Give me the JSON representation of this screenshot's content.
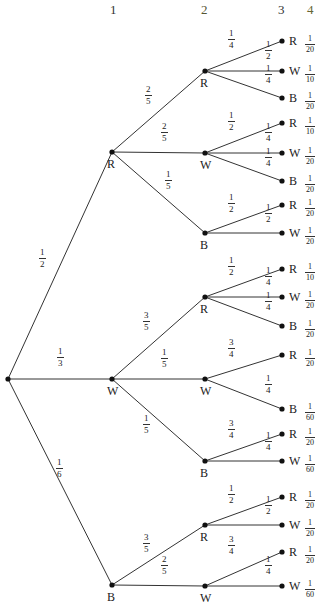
{
  "header": {
    "columns": [
      {
        "label": "1",
        "x": 110,
        "color": "#333333"
      },
      {
        "label": "2",
        "x": 201,
        "color": "#555533"
      },
      {
        "label": "3",
        "x": 278,
        "color": "#333333"
      },
      {
        "label": "4",
        "x": 307,
        "color": "#666633"
      }
    ]
  },
  "tree": {
    "root": {
      "x": 8,
      "y": 379
    },
    "level1": [
      {
        "id": "R",
        "label": "R",
        "x": 112,
        "y": 152,
        "edge": {
          "num": "1",
          "den": "2",
          "lx": 44,
          "ly": 258
        }
      },
      {
        "id": "W",
        "label": "W",
        "x": 112,
        "y": 379,
        "edge": {
          "num": "1",
          "den": "3",
          "lx": 62,
          "ly": 357
        }
      },
      {
        "id": "B",
        "label": "B",
        "x": 112,
        "y": 585,
        "edge": {
          "num": "1",
          "den": "6",
          "lx": 61,
          "ly": 468
        }
      }
    ],
    "level2": [
      {
        "parent": 0,
        "label": "R",
        "x": 205,
        "y": 71,
        "edge": {
          "num": "2",
          "den": "5",
          "lx": 150,
          "ly": 95
        }
      },
      {
        "parent": 0,
        "label": "W",
        "x": 205,
        "y": 153,
        "edge": {
          "num": "2",
          "den": "5",
          "lx": 166,
          "ly": 132
        }
      },
      {
        "parent": 0,
        "label": "B",
        "x": 205,
        "y": 233,
        "edge": {
          "num": "1",
          "den": "5",
          "lx": 170,
          "ly": 180
        }
      },
      {
        "parent": 1,
        "label": "R",
        "x": 205,
        "y": 297,
        "edge": {
          "num": "3",
          "den": "5",
          "lx": 148,
          "ly": 321
        }
      },
      {
        "parent": 1,
        "label": "W",
        "x": 205,
        "y": 379,
        "edge": {
          "num": "1",
          "den": "5",
          "lx": 166,
          "ly": 358
        }
      },
      {
        "parent": 1,
        "label": "B",
        "x": 205,
        "y": 461,
        "edge": {
          "num": "1",
          "den": "5",
          "lx": 148,
          "ly": 424
        }
      },
      {
        "parent": 2,
        "label": "R",
        "x": 205,
        "y": 525,
        "edge": {
          "num": "3",
          "den": "5",
          "lx": 148,
          "ly": 543
        }
      },
      {
        "parent": 2,
        "label": "W",
        "x": 205,
        "y": 586,
        "edge": {
          "num": "2",
          "den": "5",
          "lx": 166,
          "ly": 565
        }
      }
    ],
    "level3": [
      {
        "parent": 0,
        "label": "R",
        "x": 282,
        "y": 41,
        "edge": {
          "num": "1",
          "den": "4",
          "lx": 233,
          "ly": 39
        },
        "prob": {
          "num": "1",
          "den": "20"
        }
      },
      {
        "parent": 0,
        "label": "W",
        "x": 282,
        "y": 71,
        "edge": {
          "num": "1",
          "den": "2",
          "lx": 270,
          "ly": 50
        },
        "prob": {
          "num": "1",
          "den": "10"
        }
      },
      {
        "parent": 0,
        "label": "B",
        "x": 282,
        "y": 98,
        "edge": {
          "num": "1",
          "den": "4",
          "lx": 270,
          "ly": 74
        },
        "prob": {
          "num": "1",
          "den": "20"
        }
      },
      {
        "parent": 1,
        "label": "R",
        "x": 282,
        "y": 123,
        "edge": {
          "num": "1",
          "den": "2",
          "lx": 233,
          "ly": 121
        },
        "prob": {
          "num": "1",
          "den": "10"
        }
      },
      {
        "parent": 1,
        "label": "W",
        "x": 282,
        "y": 153,
        "edge": {
          "num": "1",
          "den": "4",
          "lx": 270,
          "ly": 132
        },
        "prob": {
          "num": "1",
          "den": "20"
        }
      },
      {
        "parent": 1,
        "label": "B",
        "x": 282,
        "y": 181,
        "edge": {
          "num": "1",
          "den": "4",
          "lx": 270,
          "ly": 157
        },
        "prob": {
          "num": "1",
          "den": "20"
        }
      },
      {
        "parent": 2,
        "label": "R",
        "x": 282,
        "y": 205,
        "edge": {
          "num": "1",
          "den": "2",
          "lx": 233,
          "ly": 203
        },
        "prob": {
          "num": "1",
          "den": "20"
        }
      },
      {
        "parent": 2,
        "label": "W",
        "x": 282,
        "y": 233,
        "edge": {
          "num": "1",
          "den": "2",
          "lx": 270,
          "ly": 213
        },
        "prob": {
          "num": "1",
          "den": "20"
        }
      },
      {
        "parent": 3,
        "label": "R",
        "x": 282,
        "y": 269,
        "edge": {
          "num": "1",
          "den": "2",
          "lx": 233,
          "ly": 266
        },
        "prob": {
          "num": "1",
          "den": "10"
        }
      },
      {
        "parent": 3,
        "label": "W",
        "x": 282,
        "y": 297,
        "edge": {
          "num": "1",
          "den": "4",
          "lx": 270,
          "ly": 276
        },
        "prob": {
          "num": "1",
          "den": "20"
        }
      },
      {
        "parent": 3,
        "label": "B",
        "x": 282,
        "y": 326,
        "edge": {
          "num": "1",
          "den": "4",
          "lx": 270,
          "ly": 301
        },
        "prob": {
          "num": "1",
          "den": "20"
        }
      },
      {
        "parent": 4,
        "label": "R",
        "x": 282,
        "y": 355,
        "edge": {
          "num": "3",
          "den": "4",
          "lx": 233,
          "ly": 348
        },
        "prob": {
          "num": "1",
          "den": "20"
        }
      },
      {
        "parent": 4,
        "label": "B",
        "x": 282,
        "y": 409,
        "edge": {
          "num": "1",
          "den": "4",
          "lx": 270,
          "ly": 384
        },
        "prob": {
          "num": "1",
          "den": "60"
        }
      },
      {
        "parent": 5,
        "label": "R",
        "x": 282,
        "y": 434,
        "edge": {
          "num": "3",
          "den": "4",
          "lx": 233,
          "ly": 429
        },
        "prob": {
          "num": "1",
          "den": "20"
        }
      },
      {
        "parent": 5,
        "label": "W",
        "x": 282,
        "y": 461,
        "edge": {
          "num": "1",
          "den": "4",
          "lx": 270,
          "ly": 441
        },
        "prob": {
          "num": "1",
          "den": "60"
        }
      },
      {
        "parent": 6,
        "label": "R",
        "x": 282,
        "y": 497,
        "edge": {
          "num": "1",
          "den": "2",
          "lx": 233,
          "ly": 494
        },
        "prob": {
          "num": "1",
          "den": "20"
        }
      },
      {
        "parent": 6,
        "label": "W",
        "x": 282,
        "y": 525,
        "edge": {
          "num": "1",
          "den": "2",
          "lx": 270,
          "ly": 505
        },
        "prob": {
          "num": "1",
          "den": "20"
        }
      },
      {
        "parent": 7,
        "label": "R",
        "x": 282,
        "y": 552,
        "edge": {
          "num": "3",
          "den": "4",
          "lx": 233,
          "ly": 545
        },
        "prob": {
          "num": "1",
          "den": "20"
        }
      },
      {
        "parent": 7,
        "label": "W",
        "x": 282,
        "y": 586,
        "edge": {
          "num": "1",
          "den": "4",
          "lx": 270,
          "ly": 565
        },
        "prob": {
          "num": "1",
          "den": "60"
        }
      }
    ]
  }
}
